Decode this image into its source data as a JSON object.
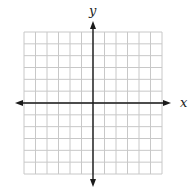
{
  "diagram": {
    "type": "coordinate-plane",
    "x_axis_label": "x",
    "y_axis_label": "y",
    "grid": {
      "columns": 12,
      "rows": 12,
      "left": 24,
      "top": 32,
      "width": 138,
      "height": 142,
      "origin_column": 6,
      "origin_row": 6
    },
    "colors": {
      "grid_line": "#c8c8c8",
      "axis": "#1a1a1a",
      "label": "#222222",
      "background": "#ffffff"
    },
    "axes": {
      "x_left_tip": 15,
      "x_right_tip": 171,
      "y_top_tip": 21,
      "y_bottom_tip": 187
    }
  }
}
